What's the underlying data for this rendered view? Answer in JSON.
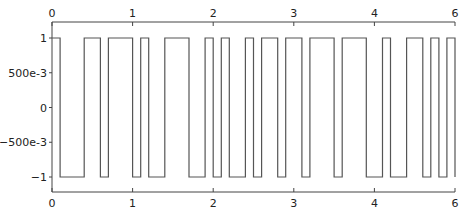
{
  "chart_data": {
    "type": "line",
    "style": "step",
    "title": "",
    "xlabel": "",
    "ylabel": "",
    "xlim": [
      0,
      5
    ],
    "ylim": [
      -1,
      1
    ],
    "grid": false,
    "legend": null,
    "x_tick_labels_top": [
      "0",
      "1",
      "2",
      "3",
      "4",
      "6"
    ],
    "x_tick_labels_bottom": [
      "0",
      "1",
      "2",
      "3",
      "4",
      "6"
    ],
    "x_tick_positions": [
      0,
      1,
      2,
      3,
      4,
      5
    ],
    "y_tick_labels": [
      "1",
      "500e-3",
      "0",
      "−500e-3",
      "−1"
    ],
    "y_tick_values": [
      1,
      0.5,
      0,
      -0.5,
      -1
    ],
    "series": [
      {
        "name": "square-wave signal",
        "color": "#555555",
        "x": [
          0,
          0.1,
          0.1,
          0.4,
          0.4,
          0.6,
          0.6,
          0.7,
          0.7,
          1.0,
          1.0,
          1.1,
          1.1,
          1.2,
          1.2,
          1.4,
          1.4,
          1.7,
          1.7,
          1.9,
          1.9,
          2.0,
          2.0,
          2.1,
          2.1,
          2.2,
          2.2,
          2.4,
          2.4,
          2.5,
          2.5,
          2.6,
          2.6,
          2.8,
          2.8,
          2.9,
          2.9,
          3.1,
          3.1,
          3.2,
          3.2,
          3.5,
          3.5,
          3.6,
          3.6,
          3.9,
          3.9,
          4.1,
          4.1,
          4.2,
          4.2,
          4.4,
          4.4,
          4.6,
          4.6,
          4.7,
          4.7,
          4.8,
          4.8,
          4.9,
          4.9,
          5.0,
          5.0
        ],
        "y": [
          1,
          1,
          -1,
          -1,
          1,
          1,
          -1,
          -1,
          1,
          1,
          -1,
          -1,
          1,
          1,
          -1,
          -1,
          1,
          1,
          -1,
          -1,
          1,
          1,
          -1,
          -1,
          1,
          1,
          -1,
          -1,
          1,
          1,
          -1,
          -1,
          1,
          1,
          -1,
          -1,
          1,
          1,
          -1,
          -1,
          1,
          1,
          -1,
          -1,
          1,
          1,
          -1,
          -1,
          1,
          1,
          -1,
          -1,
          1,
          1,
          -1,
          -1,
          1,
          1,
          -1,
          -1,
          1,
          1,
          -1
        ]
      }
    ]
  }
}
